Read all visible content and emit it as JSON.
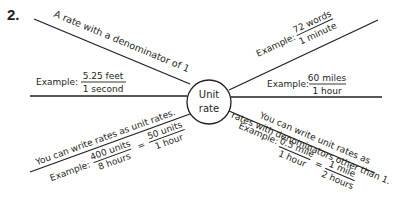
{
  "problem_number": "2.",
  "center": {
    "line1": "Unit",
    "line2": "rate"
  },
  "branches": {
    "definition": {
      "text": "A rate with a denominator of 1"
    },
    "example_left": {
      "label": "Example:",
      "numerator": "5.25 feet",
      "denominator": "1 second"
    },
    "example_upper_right": {
      "label": "Example:",
      "numerator": "72 words",
      "denominator": "1 minute"
    },
    "example_right": {
      "label": "Example:",
      "numerator": "60 miles",
      "denominator": "1 hour"
    },
    "fact_lower_left": {
      "text": "You can write rates as unit rates.",
      "label": "Example:",
      "lhs_num": "400 units",
      "lhs_den": "8 hours",
      "equals": "=",
      "rhs_num": "50 units",
      "rhs_den": "1 hour"
    },
    "fact_lower_right": {
      "text_line1": "You can write unit rates as",
      "text_line2": "rates with denominators other than 1.",
      "label": "Example:",
      "lhs_num": "0.5 mile",
      "lhs_den": "1 hour",
      "equals": "=",
      "rhs_num": "1 mile",
      "rhs_den": "2 hours"
    }
  }
}
